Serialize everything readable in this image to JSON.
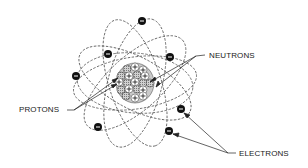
{
  "diagram": {
    "labels": {
      "neutrons": "NEUTRONS",
      "protons": "PROTONS",
      "electrons": "ELECTRONS"
    },
    "nucleus": {
      "center": [
        135,
        83
      ],
      "particles": [
        {
          "type": "neutron",
          "x": 127,
          "y": 69
        },
        {
          "type": "proton",
          "x": 135,
          "y": 67
        },
        {
          "type": "proton",
          "x": 143,
          "y": 70
        },
        {
          "type": "neutron",
          "x": 121,
          "y": 76
        },
        {
          "type": "proton",
          "x": 129,
          "y": 76
        },
        {
          "type": "neutron",
          "x": 137,
          "y": 75
        },
        {
          "type": "proton",
          "x": 145,
          "y": 76
        },
        {
          "type": "proton",
          "x": 119,
          "y": 82
        },
        {
          "type": "neutron",
          "x": 127,
          "y": 83
        },
        {
          "type": "proton",
          "x": 135,
          "y": 82
        },
        {
          "type": "neutron",
          "x": 143,
          "y": 83
        },
        {
          "type": "neutron",
          "x": 150,
          "y": 83
        },
        {
          "type": "neutron",
          "x": 121,
          "y": 90
        },
        {
          "type": "proton",
          "x": 129,
          "y": 89
        },
        {
          "type": "neutron",
          "x": 137,
          "y": 89
        },
        {
          "type": "proton",
          "x": 143,
          "y": 90
        },
        {
          "type": "neutron",
          "x": 126,
          "y": 96
        },
        {
          "type": "proton",
          "x": 135,
          "y": 98
        },
        {
          "type": "proton",
          "x": 143,
          "y": 96
        }
      ]
    },
    "electrons": [
      {
        "x": 142,
        "y": 21
      },
      {
        "x": 108,
        "y": 54
      },
      {
        "x": 170,
        "y": 57
      },
      {
        "x": 76,
        "y": 76
      },
      {
        "x": 181,
        "y": 109
      },
      {
        "x": 169,
        "y": 131
      },
      {
        "x": 98,
        "y": 127
      }
    ],
    "colors": {
      "line": "#333333",
      "orbit": "#555555",
      "electron": "#111111",
      "neutron": "#b8b8b8",
      "proton": "#ffffff"
    }
  }
}
